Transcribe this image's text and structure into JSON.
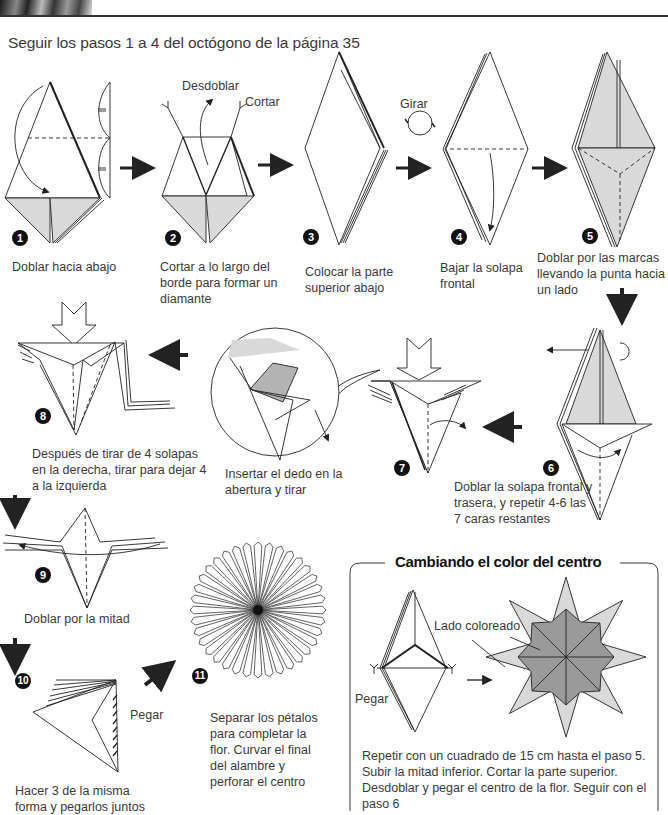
{
  "intro": "Seguir los pasos 1 a 4 del octógono de la página 35",
  "colors": {
    "fill": "#d9d9d9",
    "fill_dark": "#9a9a9a",
    "fill_light": "#c8c8c8",
    "line": "#222222"
  },
  "steps": [
    {
      "n": "1",
      "caption": "Doblar hacia abajo"
    },
    {
      "n": "2",
      "caption": "Cortar a lo largo del borde para formar un diamante",
      "labels": [
        "Desdoblar",
        "Cortar"
      ]
    },
    {
      "n": "3",
      "caption": "Colocar la parte superior abajo",
      "labels": [
        "Girar"
      ]
    },
    {
      "n": "4",
      "caption": "Bajar la solapa frontal"
    },
    {
      "n": "5",
      "caption": "Doblar por las marcas llevando la punta hacia un lado"
    },
    {
      "n": "6",
      "caption": "Doblar la solapa frontal y trasera, y repetir 4-6 las 7 caras restantes"
    },
    {
      "n": "7",
      "caption": ""
    },
    {
      "n": "8",
      "caption": "Después de tirar de 4 solapas en la derecha, tirar para dejar 4 a la izquierda"
    },
    {
      "n": "9",
      "caption": "Doblar por la mitad"
    },
    {
      "n": "10",
      "caption": "Hacer 3 de la misma forma y pegarlos juntos",
      "labels": [
        "Pegar"
      ]
    },
    {
      "n": "11",
      "caption": "Separar los pétalos para completar la flor. Curvar el final del alambre y perforar el centro"
    }
  ],
  "detail": {
    "caption": "Insertar el dedo en la abertura y tirar"
  },
  "box": {
    "title": "Cambiando el color del centro",
    "labels": [
      "Lado coloreado",
      "Pegar"
    ],
    "text": "Repetir con un cuadrado de 15 cm hasta el paso 5. Subir la mitad inferior. Cortar la parte superior. Desdoblar y pegar el centro de la flor. Seguir con el paso 6"
  }
}
